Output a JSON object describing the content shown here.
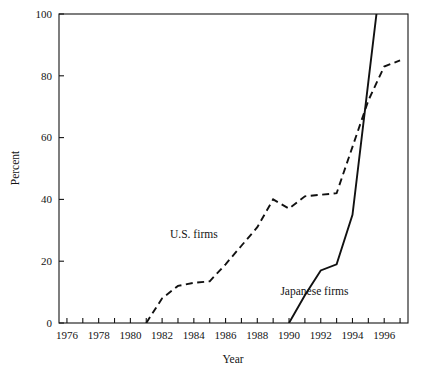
{
  "chart_data": {
    "type": "line",
    "title": "",
    "xlabel": "Year",
    "ylabel": "Percent",
    "xlim": [
      1975.5,
      1997.5
    ],
    "ylim": [
      0,
      100
    ],
    "grid": false,
    "legend_position": "inline-annotation",
    "x_tick_labels": [
      "1976",
      "1978",
      "1980",
      "1982",
      "1984",
      "1986",
      "1988",
      "1990",
      "1992",
      "1994",
      "1996"
    ],
    "x_tick_values": [
      1976,
      1978,
      1980,
      1982,
      1984,
      1986,
      1988,
      1990,
      1992,
      1994,
      1996
    ],
    "x_minor_ticks": [
      1977,
      1979,
      1981,
      1983,
      1985,
      1987,
      1989,
      1991,
      1993,
      1995,
      1997
    ],
    "y_tick_labels": [
      "0",
      "20",
      "40",
      "60",
      "80",
      "100"
    ],
    "y_tick_values": [
      0,
      20,
      40,
      60,
      80,
      100
    ],
    "series": [
      {
        "name": "U.S. firms",
        "style": "dashed",
        "color": "#111111",
        "label_x": 1984.0,
        "label_y": 27.5,
        "x": [
          1981,
          1982,
          1983,
          1984,
          1985,
          1986,
          1987,
          1988,
          1989,
          1990,
          1991,
          1992,
          1993,
          1994,
          1995,
          1996,
          1997
        ],
        "values": [
          0,
          8,
          12,
          13,
          13.5,
          19,
          25,
          31,
          40,
          37,
          41,
          41.5,
          42,
          57,
          72,
          83,
          85
        ]
      },
      {
        "name": "Japanese firms",
        "style": "solid",
        "color": "#111111",
        "label_x": 1991.6,
        "label_y": 9.0,
        "x": [
          1990,
          1991,
          1992,
          1993,
          1994,
          1995,
          1996
        ],
        "values": [
          0,
          9,
          17,
          19,
          35,
          78,
          121
        ]
      }
    ]
  },
  "axis": {
    "ylabel_text": "Percent",
    "xlabel_text": "Year"
  }
}
